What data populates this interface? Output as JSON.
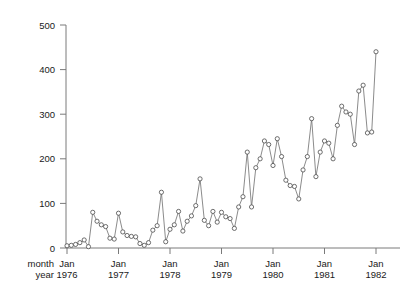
{
  "chart_data": {
    "type": "line",
    "title": "",
    "xlabel": "",
    "ylabel": "",
    "ylim": [
      0,
      500
    ],
    "yticks": [
      0,
      100,
      200,
      300,
      400,
      500
    ],
    "ytick_labels": [
      "0",
      "100",
      "200",
      "300",
      "400",
      "500"
    ],
    "grid": false,
    "legend": null,
    "marker": "open-circle",
    "row_labels": [
      "month",
      "year"
    ],
    "xtick_months": [
      "Jan",
      "Jan",
      "Jan",
      "Jan",
      "Jan",
      "Jan",
      "Jan"
    ],
    "xtick_years": [
      "1976",
      "1977",
      "1978",
      "1979",
      "1980",
      "1981",
      "1982"
    ],
    "x_start": "1976-01",
    "x_end": "1982-01",
    "x": [
      "1976-01",
      "1976-02",
      "1976-03",
      "1976-04",
      "1976-05",
      "1976-06",
      "1976-07",
      "1976-08",
      "1976-09",
      "1976-10",
      "1976-11",
      "1976-12",
      "1977-01",
      "1977-02",
      "1977-03",
      "1977-04",
      "1977-05",
      "1977-06",
      "1977-07",
      "1977-08",
      "1977-09",
      "1977-10",
      "1977-11",
      "1977-12",
      "1978-01",
      "1978-02",
      "1978-03",
      "1978-04",
      "1978-05",
      "1978-06",
      "1978-07",
      "1978-08",
      "1978-09",
      "1978-10",
      "1978-11",
      "1978-12",
      "1979-01",
      "1979-02",
      "1979-03",
      "1979-04",
      "1979-05",
      "1979-06",
      "1979-07",
      "1979-08",
      "1979-09",
      "1979-10",
      "1979-11",
      "1979-12",
      "1980-01",
      "1980-02",
      "1980-03",
      "1980-04",
      "1980-05",
      "1980-06",
      "1980-07",
      "1980-08",
      "1980-09",
      "1980-10",
      "1980-11",
      "1980-12",
      "1981-01",
      "1981-02",
      "1981-03",
      "1981-04",
      "1981-05",
      "1981-06",
      "1981-07",
      "1981-08",
      "1981-09",
      "1981-10",
      "1981-11",
      "1981-12",
      "1982-01"
    ],
    "values": [
      5,
      6,
      8,
      12,
      18,
      3,
      80,
      60,
      52,
      48,
      22,
      20,
      78,
      36,
      28,
      26,
      25,
      10,
      6,
      12,
      40,
      50,
      125,
      14,
      42,
      52,
      82,
      38,
      60,
      72,
      95,
      155,
      62,
      50,
      82,
      58,
      80,
      70,
      66,
      44,
      92,
      115,
      215,
      92,
      180,
      200,
      240,
      232,
      185,
      245,
      205,
      152,
      140,
      138,
      110,
      175,
      205,
      290,
      160,
      215,
      240,
      235,
      200,
      275,
      318,
      305,
      300,
      232,
      352,
      365,
      258,
      260,
      440
    ]
  }
}
